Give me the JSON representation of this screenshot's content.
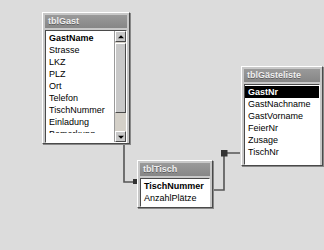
{
  "window": {
    "background_color": "#dcdcdc",
    "watermark_text": ""
  },
  "tables": [
    {
      "id": "tblGast",
      "title": "tblGast",
      "x": 42,
      "y": 12,
      "width": 88,
      "height": 132,
      "has_scrollbar": true,
      "fields": [
        {
          "label": "GastName",
          "key": true,
          "selected": false,
          "clipped": false
        },
        {
          "label": "Strasse",
          "key": false,
          "selected": false,
          "clipped": false
        },
        {
          "label": "LKZ",
          "key": false,
          "selected": false,
          "clipped": false
        },
        {
          "label": "PLZ",
          "key": false,
          "selected": false,
          "clipped": false
        },
        {
          "label": "Ort",
          "key": false,
          "selected": false,
          "clipped": false
        },
        {
          "label": "Telefon",
          "key": false,
          "selected": false,
          "clipped": false
        },
        {
          "label": "TischNummer",
          "key": false,
          "selected": false,
          "clipped": false
        },
        {
          "label": "Einladung",
          "key": false,
          "selected": false,
          "clipped": false
        },
        {
          "label": "Bemerkung",
          "key": false,
          "selected": false,
          "clipped": true
        }
      ]
    },
    {
      "id": "tblGaesteliste",
      "title": "tblGästeliste",
      "x": 241,
      "y": 66,
      "width": 82,
      "height": 100,
      "has_scrollbar": false,
      "fields": [
        {
          "label": "GastNr",
          "key": true,
          "selected": true,
          "clipped": false
        },
        {
          "label": "GastNachname",
          "key": false,
          "selected": false,
          "clipped": false
        },
        {
          "label": "GastVorname",
          "key": false,
          "selected": false,
          "clipped": false
        },
        {
          "label": "FeierNr",
          "key": false,
          "selected": false,
          "clipped": false
        },
        {
          "label": "Zusage",
          "key": false,
          "selected": false,
          "clipped": false
        },
        {
          "label": "TischNr",
          "key": false,
          "selected": false,
          "clipped": false
        }
      ]
    },
    {
      "id": "tblTisch",
      "title": "tblTisch",
      "x": 137,
      "y": 160,
      "width": 76,
      "height": 48,
      "has_scrollbar": false,
      "fields": [
        {
          "label": "TischNummer",
          "key": true,
          "selected": false,
          "clipped": false
        },
        {
          "label": "AnzahlPlätze",
          "key": false,
          "selected": false,
          "clipped": false
        }
      ]
    }
  ],
  "relationships": [
    {
      "id": "rel-gast-tisch",
      "from_table": "tblGast",
      "from_field": "TischNummer",
      "to_table": "tblTisch",
      "to_field": "TischNummer",
      "path": "M 131 120 L 124 120 L 124 182 L 136 182",
      "arrow_at": "from"
    },
    {
      "id": "rel-tisch-gaesteliste",
      "from_table": "tblTisch",
      "from_field": "TischNummer",
      "to_table": "tblGaesteliste",
      "to_field": "TischNr",
      "path": "M 214 190 L 224 190 L 224 153 L 240 153",
      "arrow_at": "to"
    }
  ],
  "scrollbar": {
    "up_arrow": "scroll-up-arrow",
    "down_arrow": "scroll-down-arrow",
    "thumb_label": "scroll-thumb"
  }
}
